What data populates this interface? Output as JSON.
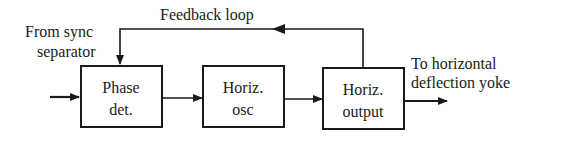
{
  "diagram": {
    "blocks": [
      {
        "id": "phase-det",
        "line1": "Phase",
        "line2": "det."
      },
      {
        "id": "horiz-osc",
        "line1": "Horiz.",
        "line2": "osc"
      },
      {
        "id": "horiz-output",
        "line1": "Horiz.",
        "line2": "output"
      }
    ],
    "labels": {
      "feedback": "Feedback loop",
      "input_line1": "From sync",
      "input_line2": "separator",
      "output_line1": "To horizontal",
      "output_line2": "deflection yoke"
    },
    "colors": {
      "stroke": "#1a1a1a",
      "background": "#ffffff"
    }
  }
}
